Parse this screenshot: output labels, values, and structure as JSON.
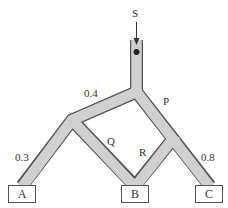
{
  "diagram": {
    "source": {
      "label": "S"
    },
    "edges": [
      {
        "id": "upper-left",
        "label": "0.4"
      },
      {
        "id": "lower-left",
        "label": "0.3"
      },
      {
        "id": "right-main",
        "label": "P"
      },
      {
        "id": "middle-left",
        "label": "Q"
      },
      {
        "id": "middle-right",
        "label": "R"
      },
      {
        "id": "lower-right",
        "label": "0.8"
      }
    ],
    "outlets": [
      {
        "id": "A",
        "label": "A"
      },
      {
        "id": "B",
        "label": "B"
      },
      {
        "id": "C",
        "label": "C"
      }
    ],
    "colors": {
      "pipe_fill": "#d0d0d0",
      "pipe_edge": "#555555",
      "ball": "#222222",
      "text": "#333333"
    }
  }
}
